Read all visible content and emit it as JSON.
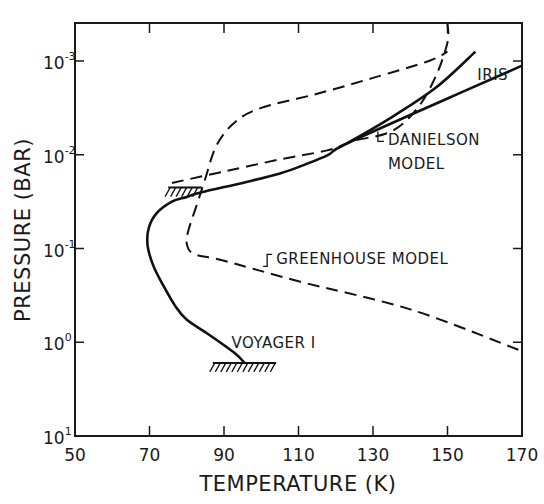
{
  "chart_data": {
    "type": "line",
    "title": "",
    "xlabel": "TEMPERATURE (K)",
    "ylabel": "PRESSURE (BAR)",
    "xlim": [
      50,
      170
    ],
    "ylim_log10": [
      1,
      -3.4
    ],
    "y_scale": "log",
    "y_inverted": true,
    "grid": false,
    "x_ticks": [
      50,
      70,
      90,
      110,
      130,
      150,
      170
    ],
    "x_tick_labels": [
      "50",
      "70",
      "90",
      "110",
      "130",
      "150",
      "170"
    ],
    "y_ticks_exponent": [
      -3,
      -2,
      -1,
      0,
      1
    ],
    "y_tick_labels": [
      {
        "base": "10",
        "exp": "-3"
      },
      {
        "base": "10",
        "exp": "-2"
      },
      {
        "base": "10",
        "exp": "-1"
      },
      {
        "base": "10",
        "exp": "0"
      },
      {
        "base": "10",
        "exp": "1"
      }
    ],
    "series": [
      {
        "name": "Voyager I",
        "style": "solid",
        "points_T_log10P": [
          [
            95.5,
            0.22
          ],
          [
            93,
            0.12
          ],
          [
            86,
            -0.08
          ],
          [
            80,
            -0.24
          ],
          [
            77,
            -0.38
          ],
          [
            73.5,
            -0.62
          ],
          [
            71,
            -0.82
          ],
          [
            69.5,
            -1.03
          ],
          [
            69.8,
            -1.22
          ],
          [
            72,
            -1.38
          ],
          [
            76,
            -1.5
          ],
          [
            80,
            -1.55
          ],
          [
            84,
            -1.6
          ],
          [
            95,
            -1.7
          ],
          [
            105,
            -1.8
          ],
          [
            112,
            -1.9
          ],
          [
            118,
            -2.0
          ],
          [
            123,
            -2.12
          ],
          [
            150,
            -2.6
          ],
          [
            170,
            -2.95
          ]
        ]
      },
      {
        "name": "IRIS",
        "style": "solid",
        "points_T_log10P": [
          [
            123,
            -2.12
          ],
          [
            135,
            -2.4
          ],
          [
            147,
            -2.72
          ],
          [
            157.5,
            -3.1
          ]
        ]
      },
      {
        "name": "Danielson Model",
        "style": "dashed",
        "points_T_log10P": [
          [
            76,
            -1.7
          ],
          [
            90,
            -1.82
          ],
          [
            105,
            -1.95
          ],
          [
            118,
            -2.05
          ],
          [
            125,
            -2.15
          ],
          [
            135,
            -2.25
          ],
          [
            142,
            -2.5
          ],
          [
            147,
            -2.85
          ],
          [
            150,
            -3.2
          ],
          [
            150,
            -3.4
          ]
        ]
      },
      {
        "name": "Greenhouse Model",
        "style": "dashed",
        "points_T_log10P": [
          [
            169,
            0.08
          ],
          [
            140,
            -0.35
          ],
          [
            110,
            -0.65
          ],
          [
            90,
            -0.87
          ],
          [
            82,
            -0.94
          ],
          [
            80,
            -1.05
          ],
          [
            80.5,
            -1.2
          ],
          [
            83,
            -1.5
          ],
          [
            85,
            -1.75
          ],
          [
            88,
            -2.1
          ],
          [
            93,
            -2.35
          ],
          [
            100,
            -2.5
          ],
          [
            115,
            -2.65
          ],
          [
            130,
            -2.82
          ],
          [
            145,
            -3.0
          ],
          [
            150,
            -3.1
          ]
        ]
      }
    ],
    "annotations": [
      {
        "text": "IRIS",
        "near_T": 158,
        "near_log10P": -2.8
      },
      {
        "text": "DANIELSON",
        "near_T": 134,
        "near_log10P": -2.1
      },
      {
        "text": "MODEL",
        "near_T": 134,
        "near_log10P": -1.85
      },
      {
        "text": "GREENHOUSE MODEL",
        "near_T": 104,
        "near_log10P": -0.83
      },
      {
        "text": "VOYAGER I",
        "near_T": 92,
        "near_log10P": 0.06
      }
    ],
    "hatched_boundaries": [
      {
        "T_range": [
          75,
          84
        ],
        "log10P": -1.65
      },
      {
        "T_range": [
          87,
          104
        ],
        "log10P": 0.22
      }
    ]
  }
}
